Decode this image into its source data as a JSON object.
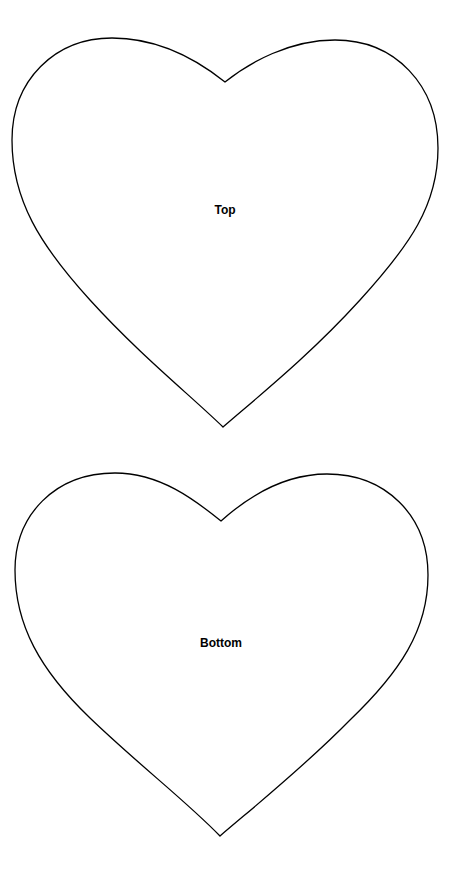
{
  "page": {
    "background": "#ffffff",
    "stroke_color": "#000000"
  },
  "hearts": [
    {
      "id": "top",
      "label": "Top"
    },
    {
      "id": "bottom",
      "label": "Bottom"
    }
  ]
}
